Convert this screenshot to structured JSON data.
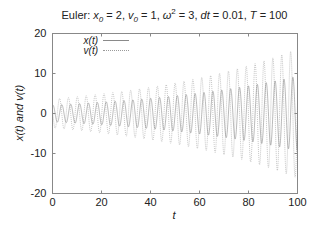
{
  "chart_data": {
    "type": "line",
    "title_parts": {
      "prefix": "Euler: ",
      "x0_label": "x",
      "x0_sub": "0",
      "x0_value": " = 2, ",
      "v0_label": "v",
      "v0_sub": "0",
      "v0_value": " = 1, ",
      "omega": "ω",
      "omega_sup": "2",
      "omega_value": " = 3, ",
      "dt_label": "dt",
      "dt_value": " = 0.01, ",
      "T_label": "T",
      "T_value": " = 100"
    },
    "xlabel": "t",
    "ylabel": "x(t) and v(t)",
    "xlim": [
      0,
      100
    ],
    "ylim": [
      -20,
      20
    ],
    "xticks": [
      0,
      20,
      40,
      60,
      80,
      100
    ],
    "yticks": [
      -20,
      -10,
      0,
      10,
      20
    ],
    "grid": false,
    "legend_position": "upper-left",
    "parameters": {
      "x0": 2,
      "v0": 1,
      "omega_squared": 3,
      "dt": 0.01,
      "T": 100
    },
    "series": [
      {
        "name": "x(t)",
        "style": "solid",
        "color": "#888888",
        "description": "Oscillation with amplitude growing from ~2.1 to ~9.3 (Euler energy growth)"
      },
      {
        "name": "v(t)",
        "style": "dotted",
        "color": "#999999",
        "description": "Oscillation with amplitude growing from ~3.6 to ~16"
      }
    ]
  },
  "colors": {
    "axis": "#888888",
    "text": "#222222",
    "x_series": "#8a8a8a",
    "v_series": "#a0a0a0"
  }
}
